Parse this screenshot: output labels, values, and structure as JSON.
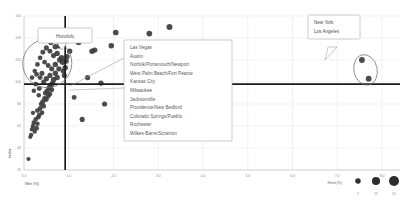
{
  "chart_data": {
    "type": "scatter",
    "title": "",
    "xlabel": "Wet (%)",
    "ylabel": "Index",
    "xlim": [
      0.0,
      8.4
    ],
    "ylim": [
      20,
      160
    ],
    "xticks": [
      "0.0",
      "1.0",
      "2.0",
      "3.0",
      "4.0",
      "5.0",
      "6.0",
      "7.0",
      "8.0"
    ],
    "xtick_values": [
      0.0,
      1.0,
      2.0,
      3.0,
      4.0,
      5.0,
      6.0,
      7.0,
      8.0
    ],
    "yticks": [
      "160",
      "140",
      "120",
      "100",
      "80",
      "60",
      "40",
      "20"
    ],
    "ytick_values": [
      160,
      140,
      120,
      100,
      80,
      60,
      40,
      20
    ],
    "grid": true,
    "legend_position": "bottom-right",
    "size_legend": {
      "title": "Herd (%)",
      "values": [
        5,
        15,
        25
      ]
    },
    "reference_lines": {
      "horizontal_y": 98,
      "vertical_x": 0.92
    },
    "points": [
      {
        "x": 0.1,
        "y": 30,
        "s": 5
      },
      {
        "x": 0.14,
        "y": 50,
        "s": 5
      },
      {
        "x": 0.16,
        "y": 52,
        "s": 6
      },
      {
        "x": 0.18,
        "y": 57,
        "s": 7
      },
      {
        "x": 0.2,
        "y": 60,
        "s": 6
      },
      {
        "x": 0.22,
        "y": 63,
        "s": 8
      },
      {
        "x": 0.24,
        "y": 55,
        "s": 6
      },
      {
        "x": 0.26,
        "y": 66,
        "s": 7
      },
      {
        "x": 0.2,
        "y": 72,
        "s": 6
      },
      {
        "x": 0.28,
        "y": 58,
        "s": 9
      },
      {
        "x": 0.3,
        "y": 62,
        "s": 7
      },
      {
        "x": 0.32,
        "y": 68,
        "s": 8
      },
      {
        "x": 0.3,
        "y": 74,
        "s": 9
      },
      {
        "x": 0.34,
        "y": 70,
        "s": 7
      },
      {
        "x": 0.36,
        "y": 76,
        "s": 8
      },
      {
        "x": 0.38,
        "y": 80,
        "s": 7
      },
      {
        "x": 0.4,
        "y": 72,
        "s": 9
      },
      {
        "x": 0.42,
        "y": 82,
        "s": 10
      },
      {
        "x": 0.44,
        "y": 78,
        "s": 8
      },
      {
        "x": 0.46,
        "y": 85,
        "s": 9
      },
      {
        "x": 0.33,
        "y": 88,
        "s": 7
      },
      {
        "x": 0.48,
        "y": 90,
        "s": 10
      },
      {
        "x": 0.5,
        "y": 84,
        "s": 8
      },
      {
        "x": 0.52,
        "y": 92,
        "s": 11
      },
      {
        "x": 0.54,
        "y": 87,
        "s": 9
      },
      {
        "x": 0.56,
        "y": 95,
        "s": 10
      },
      {
        "x": 0.58,
        "y": 89,
        "s": 8
      },
      {
        "x": 0.6,
        "y": 97,
        "s": 12
      },
      {
        "x": 0.62,
        "y": 93,
        "s": 9
      },
      {
        "x": 0.64,
        "y": 99,
        "s": 11
      },
      {
        "x": 0.44,
        "y": 100,
        "s": 10
      },
      {
        "x": 0.36,
        "y": 104,
        "s": 9
      },
      {
        "x": 0.28,
        "y": 107,
        "s": 8
      },
      {
        "x": 0.5,
        "y": 103,
        "s": 11
      },
      {
        "x": 0.58,
        "y": 106,
        "s": 10
      },
      {
        "x": 0.66,
        "y": 102,
        "s": 12
      },
      {
        "x": 0.7,
        "y": 108,
        "s": 11
      },
      {
        "x": 0.74,
        "y": 104,
        "s": 13
      },
      {
        "x": 0.62,
        "y": 112,
        "s": 10
      },
      {
        "x": 0.54,
        "y": 115,
        "s": 9
      },
      {
        "x": 0.46,
        "y": 118,
        "s": 8
      },
      {
        "x": 0.7,
        "y": 116,
        "s": 12
      },
      {
        "x": 0.78,
        "y": 112,
        "s": 11
      },
      {
        "x": 0.8,
        "y": 120,
        "s": 13
      },
      {
        "x": 0.66,
        "y": 124,
        "s": 10
      },
      {
        "x": 0.58,
        "y": 128,
        "s": 9
      },
      {
        "x": 0.74,
        "y": 126,
        "s": 12
      },
      {
        "x": 0.84,
        "y": 122,
        "s": 14
      },
      {
        "x": 0.86,
        "y": 118,
        "s": 12
      },
      {
        "x": 0.88,
        "y": 110,
        "s": 11
      },
      {
        "x": 0.9,
        "y": 106,
        "s": 10
      },
      {
        "x": 0.92,
        "y": 113,
        "s": 13
      },
      {
        "x": 0.94,
        "y": 119,
        "s": 12
      },
      {
        "x": 0.96,
        "y": 123,
        "s": 11
      },
      {
        "x": 0.7,
        "y": 132,
        "s": 13
      },
      {
        "x": 0.8,
        "y": 133,
        "s": 14
      },
      {
        "x": 0.6,
        "y": 136,
        "s": 11
      },
      {
        "x": 0.5,
        "y": 131,
        "s": 10
      },
      {
        "x": 0.42,
        "y": 127,
        "s": 9
      },
      {
        "x": 0.36,
        "y": 122,
        "s": 8
      },
      {
        "x": 0.3,
        "y": 116,
        "s": 8
      },
      {
        "x": 0.24,
        "y": 110,
        "s": 7
      },
      {
        "x": 0.18,
        "y": 104,
        "s": 7
      },
      {
        "x": 0.26,
        "y": 98,
        "s": 8
      },
      {
        "x": 0.34,
        "y": 94,
        "s": 9
      },
      {
        "x": 0.22,
        "y": 92,
        "s": 7
      },
      {
        "x": 0.4,
        "y": 108,
        "s": 10
      },
      {
        "x": 1.02,
        "y": 128,
        "s": 12
      },
      {
        "x": 1.12,
        "y": 86,
        "s": 9
      },
      {
        "x": 1.22,
        "y": 136,
        "s": 13
      },
      {
        "x": 1.3,
        "y": 66,
        "s": 10
      },
      {
        "x": 1.42,
        "y": 104,
        "s": 11
      },
      {
        "x": 1.52,
        "y": 128,
        "s": 13
      },
      {
        "x": 1.58,
        "y": 129,
        "s": 12
      },
      {
        "x": 1.72,
        "y": 99,
        "s": 11
      },
      {
        "x": 1.8,
        "y": 80,
        "s": 10
      },
      {
        "x": 1.95,
        "y": 133,
        "s": 13
      },
      {
        "x": 2.05,
        "y": 145,
        "s": 14
      },
      {
        "x": 2.45,
        "y": 96,
        "s": 11
      },
      {
        "x": 2.8,
        "y": 144,
        "s": 14
      },
      {
        "x": 3.25,
        "y": 150,
        "s": 16
      },
      {
        "x": 7.55,
        "y": 120,
        "s": 15
      },
      {
        "x": 7.7,
        "y": 103,
        "s": 15
      }
    ],
    "highlight_ellipses": [
      {
        "cx": 0.52,
        "cy": 117,
        "rx": 0.55,
        "ry": 22,
        "rotate": -22
      },
      {
        "cx": 7.63,
        "cy": 111,
        "rx": 0.26,
        "ry": 14,
        "rotate": -12
      }
    ]
  },
  "callouts": {
    "honolulu": {
      "label": "Honolulu"
    },
    "coastal": {
      "label": "New York\nLos Angeles",
      "lines": [
        "New York",
        "Los Angeles"
      ]
    }
  },
  "city_list": {
    "items": [
      "Las Vegas",
      "Austin",
      "Norfolk/Portsmouth/Newport",
      "West Palm Beach/Fort Pearce",
      "Kansas City",
      "Milwaukee",
      "Jacksonville",
      "Providence/New Bedford",
      "Colorado Springs/Pueblo",
      "Rochester",
      "Wilkes-Barre/Scranton"
    ]
  },
  "colors": {
    "point": "#3d3d3d",
    "refline": "#1b1b1b",
    "grid": "#e4e4e4",
    "box_border": "#a8a8a8",
    "text": "#5a5a5a"
  }
}
